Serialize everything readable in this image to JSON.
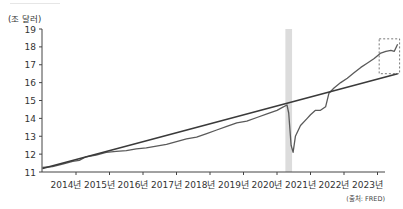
{
  "unit_label": "(조 달러)",
  "source_label": "(출처: FRED)",
  "chart_data": {
    "type": "line",
    "title": "",
    "xlabel": "",
    "ylabel": "(조 달러)",
    "ylim": [
      11,
      19
    ],
    "xlim": [
      2013.0,
      2023.6
    ],
    "yticks": [
      11,
      12,
      13,
      14,
      15,
      16,
      17,
      18,
      19
    ],
    "xticks": [
      2014,
      2015,
      2016,
      2017,
      2018,
      2019,
      2020,
      2021,
      2022,
      2023
    ],
    "xtick_labels": [
      "2014년",
      "2015년",
      "2016년",
      "2017년",
      "2018년",
      "2019년",
      "2020년",
      "2021년",
      "2022년",
      "2023년"
    ],
    "grid": false,
    "series": [
      {
        "name": "actual",
        "color": "#5a5a5a",
        "points": [
          [
            2013.0,
            11.25
          ],
          [
            2013.3,
            11.3
          ],
          [
            2013.6,
            11.45
          ],
          [
            2013.9,
            11.6
          ],
          [
            2014.1,
            11.65
          ],
          [
            2014.3,
            11.85
          ],
          [
            2014.6,
            11.95
          ],
          [
            2014.9,
            12.1
          ],
          [
            2015.2,
            12.15
          ],
          [
            2015.5,
            12.2
          ],
          [
            2015.8,
            12.3
          ],
          [
            2016.1,
            12.35
          ],
          [
            2016.4,
            12.45
          ],
          [
            2016.7,
            12.55
          ],
          [
            2017.0,
            12.7
          ],
          [
            2017.3,
            12.85
          ],
          [
            2017.6,
            12.95
          ],
          [
            2017.9,
            13.15
          ],
          [
            2018.2,
            13.35
          ],
          [
            2018.5,
            13.55
          ],
          [
            2018.8,
            13.75
          ],
          [
            2019.1,
            13.85
          ],
          [
            2019.4,
            14.05
          ],
          [
            2019.7,
            14.25
          ],
          [
            2020.0,
            14.45
          ],
          [
            2020.15,
            14.6
          ],
          [
            2020.3,
            14.75
          ],
          [
            2020.35,
            14.3
          ],
          [
            2020.42,
            12.5
          ],
          [
            2020.48,
            12.1
          ],
          [
            2020.55,
            13.0
          ],
          [
            2020.7,
            13.6
          ],
          [
            2020.9,
            14.0
          ],
          [
            2021.0,
            14.2
          ],
          [
            2021.15,
            14.45
          ],
          [
            2021.3,
            14.45
          ],
          [
            2021.45,
            14.65
          ],
          [
            2021.55,
            15.4
          ],
          [
            2021.7,
            15.7
          ],
          [
            2021.9,
            16.0
          ],
          [
            2022.1,
            16.25
          ],
          [
            2022.3,
            16.55
          ],
          [
            2022.5,
            16.85
          ],
          [
            2022.7,
            17.1
          ],
          [
            2022.9,
            17.35
          ],
          [
            2023.1,
            17.65
          ],
          [
            2023.25,
            17.75
          ],
          [
            2023.4,
            17.8
          ],
          [
            2023.5,
            17.75
          ],
          [
            2023.6,
            18.15
          ]
        ]
      },
      {
        "name": "trend",
        "color": "#3a3a3a",
        "points": [
          [
            2013.0,
            11.2
          ],
          [
            2023.6,
            16.5
          ]
        ]
      }
    ],
    "annotations": [
      {
        "type": "shaded_band",
        "label": "recession",
        "x_range": [
          2020.25,
          2020.45
        ],
        "color": "#dcdcdc"
      },
      {
        "type": "dashed_box",
        "label": "recent-gap",
        "x_range": [
          2023.05,
          2023.6
        ],
        "y_range": [
          16.5,
          18.45
        ],
        "color": "#555555"
      }
    ]
  }
}
